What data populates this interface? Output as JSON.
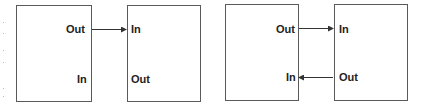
{
  "diagram": {
    "left_pair": {
      "box_a": {
        "upper_label": "Out",
        "lower_label": "In"
      },
      "box_b": {
        "upper_label": "In",
        "lower_label": "Out"
      },
      "connections": [
        {
          "from": "box_a.Out",
          "to": "box_b.In",
          "direction": "right"
        }
      ]
    },
    "right_pair": {
      "box_a": {
        "upper_label": "Out",
        "lower_label": "In"
      },
      "box_b": {
        "upper_label": "In",
        "lower_label": "Out"
      },
      "connections": [
        {
          "from": "box_a.Out",
          "to": "box_b.In",
          "direction": "right"
        },
        {
          "from": "box_b.Out",
          "to": "box_a.In",
          "direction": "left"
        }
      ]
    },
    "colors": {
      "line": "#333333",
      "border": "#5a5a5a",
      "text": "#222222"
    }
  }
}
